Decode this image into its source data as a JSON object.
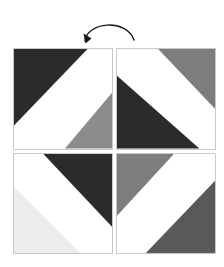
{
  "figure": {
    "background_color": "#ffffff",
    "tile_border_color": "#c9c9c9"
  },
  "rotation_arrow": {
    "icon": "curved-rotation-arrow-icon",
    "direction": "counterclockwise",
    "color": "#1a1a1a",
    "stroke_width": "1.4"
  },
  "palette": {
    "dark": "#2b2b2b",
    "white": "#ffffff",
    "gray_medium": "#8c8c8c",
    "gray": "#7d7d7d",
    "gray_dark": "#595959",
    "gray_light": "#ededed",
    "border": "#c9c9c9"
  },
  "grid": {
    "rows": 2,
    "columns": 2,
    "tiles": [
      {
        "position": "top-left",
        "band_direction": "slash",
        "bands": [
          {
            "name": "upper-left-triangle",
            "color": "#2b2b2b"
          },
          {
            "name": "center-band",
            "color": "#ffffff"
          },
          {
            "name": "lower-right-triangle",
            "color": "#8c8c8c"
          }
        ]
      },
      {
        "position": "top-right",
        "band_direction": "slash",
        "bands": [
          {
            "name": "upper-right-triangle",
            "color": "#7d7d7d"
          },
          {
            "name": "center-band",
            "color": "#ffffff"
          },
          {
            "name": "lower-left-triangle",
            "color": "#2b2b2b"
          },
          {
            "name": "lower-right-corner",
            "color": "#ffffff"
          }
        ]
      },
      {
        "position": "bottom-left",
        "band_direction": "backslash",
        "bands": [
          {
            "name": "upper-right-triangle",
            "color": "#2b2b2b"
          },
          {
            "name": "center-band",
            "color": "#ffffff"
          },
          {
            "name": "lower-left-triangle",
            "color": "#ededed"
          }
        ]
      },
      {
        "position": "bottom-right",
        "band_direction": "backslash",
        "bands": [
          {
            "name": "upper-left-triangle",
            "color": "#7d7d7d"
          },
          {
            "name": "center-band",
            "color": "#ffffff"
          },
          {
            "name": "lower-right-triangle",
            "color": "#595959"
          }
        ]
      }
    ]
  }
}
